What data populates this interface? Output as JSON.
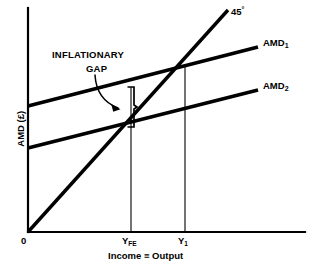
{
  "figure": {
    "kind": "keynesian-cross-inflationary-gap",
    "background_color": "#ffffff",
    "line_color": "#000000",
    "axis_color": "#000000"
  },
  "axes": {
    "y_axis_title": "AMD (£)",
    "x_axis_title": "Income ≡ Output",
    "origin_label": "0",
    "x_ticks": [
      {
        "label_html": "Y<sub>FE</sub>",
        "name": "x-tick-yfe"
      },
      {
        "label_html": "Y<sub>1</sub>",
        "name": "x-tick-y1"
      }
    ]
  },
  "curves": [
    {
      "id": "line45",
      "label_html": "45<sup>°</sup>",
      "name": "curve-label-45-degree"
    },
    {
      "id": "amd1",
      "label_html": "AMD<sub>1</sub>",
      "name": "curve-label-amd1"
    },
    {
      "id": "amd2",
      "label_html": "AMD<sub>2</sub>",
      "name": "curve-label-amd2"
    }
  ],
  "annotation": {
    "line1": "INFLATIONARY",
    "line2": "GAP"
  },
  "chart_data": {
    "type": "line",
    "title": "",
    "xlabel": "Income ≡ Output",
    "ylabel": "AMD (£)",
    "xlim": [
      0,
      1
    ],
    "ylim": [
      0,
      1
    ],
    "grid": false,
    "legend": "inline-right-of-each-curve",
    "annotations": [
      {
        "text": "INFLATIONARY GAP",
        "points_to": "vertical gap between AMD1 and AMD2 at Y_FE",
        "arrow": "curved"
      }
    ],
    "x_tick_labels": [
      "0",
      "Y_FE",
      "Y_1"
    ],
    "series": [
      {
        "name": "45°",
        "description": "45 degree line where AMD equals Income = Output, through origin",
        "points_px": [
          [
            28,
            232
          ],
          [
            228,
            10
          ]
        ]
      },
      {
        "name": "AMD_1",
        "description": "Higher aggregate monetary demand schedule; intersects 45-degree line at Y_1",
        "points_px": [
          [
            28,
            106
          ],
          [
            258,
            47
          ]
        ]
      },
      {
        "name": "AMD_2",
        "description": "Lower aggregate monetary demand schedule; intersects 45-degree line at Y_FE",
        "points_px": [
          [
            28,
            148
          ],
          [
            258,
            90
          ]
        ]
      }
    ],
    "equilibria": [
      {
        "name": "Y_FE",
        "x_px": 131,
        "y_px": 127,
        "meaning": "full-employment equilibrium on AMD_2"
      },
      {
        "name": "Y_1",
        "x_px": 185,
        "y_px": 65,
        "meaning": "equilibrium on AMD_1 above full employment"
      }
    ],
    "gap": {
      "name": "inflationary gap",
      "x_px": 131,
      "y_top_px": 87,
      "y_bottom_px": 127,
      "meaning": "vertical distance between AMD_1 and AMD_2 at the full employment level of output"
    }
  }
}
